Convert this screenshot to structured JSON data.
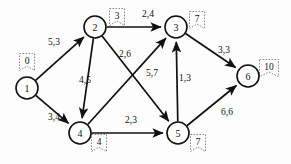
{
  "diagram": {
    "type": "directed-graph",
    "stroke_color": "#111111",
    "tag_border_color": "#8a8a8a",
    "background_color": "#fdfdfd",
    "nodes": [
      {
        "id": "1",
        "label": "1",
        "tag": "0",
        "cx": 27,
        "cy": 88,
        "r": 11,
        "tag_x": 27,
        "tag_y": 62
      },
      {
        "id": "2",
        "label": "2",
        "tag": "3",
        "cx": 95,
        "cy": 27,
        "r": 11,
        "tag_x": 117,
        "tag_y": 17
      },
      {
        "id": "3",
        "label": "3",
        "tag": "7",
        "cx": 176,
        "cy": 27,
        "r": 11,
        "tag_x": 197,
        "tag_y": 20
      },
      {
        "id": "4",
        "label": "4",
        "tag": "4",
        "cx": 80,
        "cy": 133,
        "r": 11,
        "tag_x": 99,
        "tag_y": 143
      },
      {
        "id": "5",
        "label": "5",
        "tag": "7",
        "cx": 178,
        "cy": 133,
        "r": 11,
        "tag_x": 198,
        "tag_y": 143
      },
      {
        "id": "6",
        "label": "6",
        "tag": "10",
        "cx": 248,
        "cy": 76,
        "r": 11,
        "tag_x": 269,
        "tag_y": 68
      }
    ],
    "edges": [
      {
        "from": "1",
        "to": "2",
        "label": "5,3",
        "label_x": 54,
        "label_y": 42
      },
      {
        "from": "1",
        "to": "4",
        "label": "3,4",
        "label_x": 54,
        "label_y": 117
      },
      {
        "from": "2",
        "to": "3",
        "label": "2,4",
        "label_x": 148,
        "label_y": 14
      },
      {
        "from": "2",
        "to": "4",
        "label": "4,5",
        "label_x": 85,
        "label_y": 80
      },
      {
        "from": "2",
        "to": "5",
        "label": "2,6",
        "label_x": 125,
        "label_y": 54
      },
      {
        "from": "4",
        "to": "3",
        "label": "5,7",
        "label_x": 152,
        "label_y": 73
      },
      {
        "from": "4",
        "to": "5",
        "label": "2,3",
        "label_x": 131,
        "label_y": 120
      },
      {
        "from": "5",
        "to": "3",
        "label": "1,3",
        "label_x": 185,
        "label_y": 78
      },
      {
        "from": "3",
        "to": "6",
        "label": "3,3",
        "label_x": 224,
        "label_y": 50
      },
      {
        "from": "5",
        "to": "6",
        "label": "6,6",
        "label_x": 227,
        "label_y": 112
      }
    ]
  }
}
